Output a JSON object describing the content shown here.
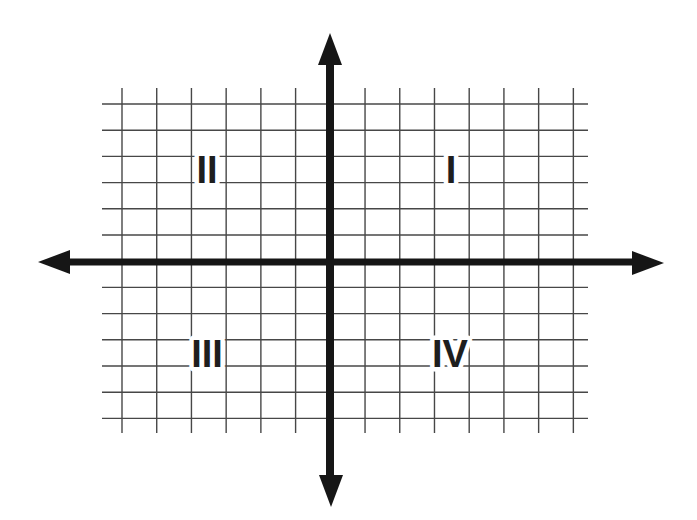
{
  "figure": {
    "type": "coordinate-plane",
    "background_color": "#ffffff",
    "grid": {
      "color": "#474747",
      "stroke_width": 1.4,
      "vertical_lines": {
        "count": 14,
        "x_start": 122,
        "spacing": 34.72,
        "y_top": 88,
        "y_bottom": 433
      },
      "horizontal_lines": {
        "count": 13,
        "y_start": 104,
        "spacing": 26.2,
        "x_left": 102,
        "x_right": 588
      }
    },
    "axes": {
      "color": "#161616",
      "x_axis": {
        "y": 262,
        "tip_left": 38,
        "tip_right": 664,
        "stroke_width": 7
      },
      "y_axis": {
        "x": 330,
        "tip_top": 33,
        "tip_bottom": 507,
        "stroke_width": 8
      },
      "arrow": {
        "length": 32,
        "half_width": 12
      }
    },
    "quadrant_labels": [
      {
        "label": "I",
        "x": 451,
        "y": 170
      },
      {
        "label": "II",
        "x": 207,
        "y": 170
      },
      {
        "label": "III",
        "x": 207,
        "y": 354
      },
      {
        "label": "IV",
        "x": 450,
        "y": 354
      }
    ],
    "label_style": {
      "color": "#1e1e1e",
      "halo_color": "#ffffff",
      "halo_width": 9
    }
  }
}
